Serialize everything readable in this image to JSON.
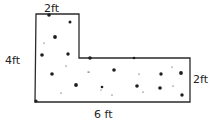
{
  "diagram": {
    "shape": "L-shaped figure",
    "labels": {
      "top": "2ft",
      "left": "4ft",
      "right": "2ft",
      "bottom": "6 ft"
    },
    "colors": {
      "stroke": "#2a2a2a",
      "dots": "#1e1e1e",
      "background": "#ffffff"
    }
  }
}
